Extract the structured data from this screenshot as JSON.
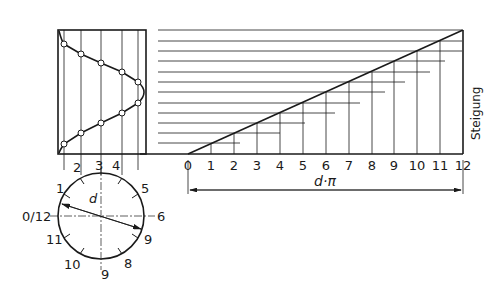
{
  "diagram": {
    "axis_label_right": "Steigung",
    "dimension_label": "d·π",
    "diameter_label": "d",
    "baseline_ticks": [
      "0",
      "1",
      "2",
      "3",
      "4",
      "5",
      "6",
      "7",
      "8",
      "9",
      "10",
      "11",
      "12"
    ],
    "side_view_ticks": [
      "2",
      "3",
      "4"
    ],
    "circle_labels": {
      "top": "3",
      "top_left_1": "1",
      "top_left_2": "2",
      "top_right_4": "4",
      "right_upper": "5",
      "left": "0/12",
      "right": "6",
      "lower_right": "9",
      "lower_left": "11",
      "bottom_left": "10",
      "bottom": "9",
      "bottom_right": "8"
    },
    "colors": {
      "line": "#1a1a1a",
      "background": "#ffffff"
    }
  }
}
